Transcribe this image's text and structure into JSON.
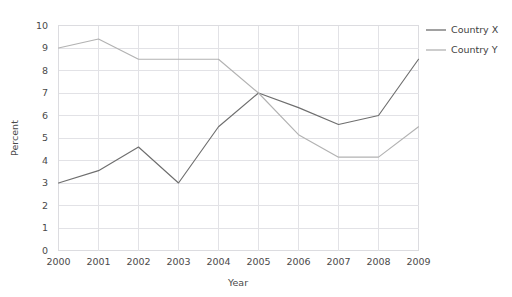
{
  "chart_data": {
    "type": "line",
    "title": "",
    "xlabel": "Year",
    "ylabel": "Percent",
    "categories": [
      "2000",
      "2001",
      "2002",
      "2003",
      "2004",
      "2005",
      "2006",
      "2007",
      "2008",
      "2009"
    ],
    "x": [
      2000,
      2001,
      2002,
      2003,
      2004,
      2005,
      2006,
      2007,
      2008,
      2009
    ],
    "xlim": [
      2000,
      2009
    ],
    "ylim": [
      0,
      10
    ],
    "yticks": [
      "0",
      "1",
      "2",
      "3",
      "4",
      "5",
      "6",
      "7",
      "8",
      "9",
      "10"
    ],
    "ytick_values": [
      0,
      1,
      2,
      3,
      4,
      5,
      6,
      7,
      8,
      9,
      10
    ],
    "grid": true,
    "legend_position": "right",
    "series": [
      {
        "name": "Country X",
        "color": "#6e6e6e",
        "values": [
          3.0,
          3.55,
          4.6,
          3.0,
          5.5,
          7.0,
          6.35,
          5.6,
          6.0,
          8.5
        ]
      },
      {
        "name": "Country Y",
        "color": "#b2b2b2",
        "values": [
          9.0,
          9.4,
          8.5,
          8.5,
          8.5,
          7.0,
          5.15,
          4.15,
          4.15,
          5.5
        ]
      }
    ]
  },
  "legend": {
    "items": [
      {
        "label": "Country X",
        "color": "#6e6e6e"
      },
      {
        "label": "Country Y",
        "color": "#b2b2b2"
      }
    ]
  },
  "axes": {
    "y_title": "Percent",
    "x_title": "Year"
  }
}
